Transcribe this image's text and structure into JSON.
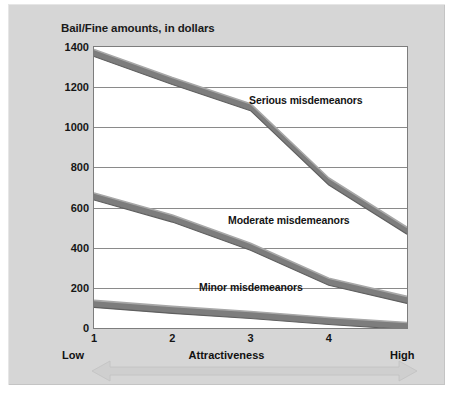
{
  "chart_data": {
    "type": "line",
    "title": "Bail/Fine amounts, in dollars",
    "xlabel": "Attractiveness",
    "ylabel": "",
    "x": [
      1,
      2,
      3,
      4,
      5
    ],
    "xticklabels": [
      "1",
      "2",
      "3",
      "4"
    ],
    "xlim": [
      1,
      5
    ],
    "ylim": [
      0,
      1400
    ],
    "yticklabels": [
      "0",
      "200",
      "400",
      "600",
      "800",
      "1000",
      "1200",
      "1400"
    ],
    "yticks": [
      0,
      200,
      400,
      600,
      800,
      1000,
      1200,
      1400
    ],
    "grid": true,
    "legend_position": "inline-annotations",
    "axis_endpoint_low": "Low",
    "axis_endpoint_high": "High",
    "series": [
      {
        "name": "Serious misdemeanors",
        "values": [
          1370,
          1230,
          1100,
          730,
          485
        ],
        "color": "#7d7d7d"
      },
      {
        "name": "Moderate misdemeanors",
        "values": [
          655,
          545,
          405,
          230,
          140
        ],
        "color": "#7d7d7d"
      },
      {
        "name": "Minor misdemeanors",
        "values": [
          120,
          90,
          65,
          35,
          10
        ],
        "color": "#7d7d7d"
      }
    ],
    "annotations": [
      {
        "text": "Serious misdemeanors"
      },
      {
        "text": "Moderate misdemeanors"
      },
      {
        "text": "Minor misdemeanors"
      }
    ]
  },
  "figure": {
    "background_color": "#d6d6d6",
    "plot_background_color": "#ffffff",
    "line_color": "#7d7d7d",
    "grid_color": "#8a8a8a",
    "arrow_color": "#c9c9c9",
    "arrow_name": "low-to-high-range-arrow"
  },
  "source_note": ""
}
